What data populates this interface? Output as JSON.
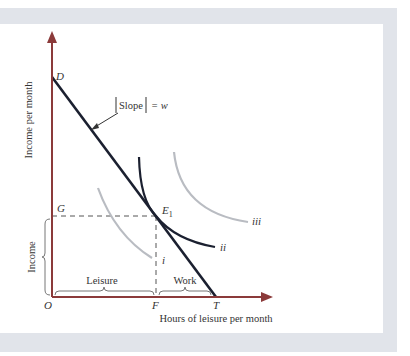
{
  "diagram": {
    "axes": {
      "y_label": "Income per month",
      "x_label": "Hours of leisure per month",
      "origin_label": "O"
    },
    "points": {
      "D": "D",
      "T": "T",
      "F": "F",
      "G": "G",
      "E1_base": "E",
      "E1_sub": "1"
    },
    "budget_line": {
      "annotation_slope": "Slope",
      "annotation_eq": "= w"
    },
    "indifference_curves": {
      "i": "i",
      "ii": "ii",
      "iii": "iii"
    },
    "braces": {
      "income": "Income",
      "leisure": "Leisure",
      "work": "Work"
    },
    "colors": {
      "axis": "#8b3a3a",
      "budget_line": "#1b2030",
      "curve_ii": "#1b2030",
      "curves_gray": "#b9bcc2",
      "frame": "#e1e4ea",
      "dashed": "#555555"
    }
  }
}
